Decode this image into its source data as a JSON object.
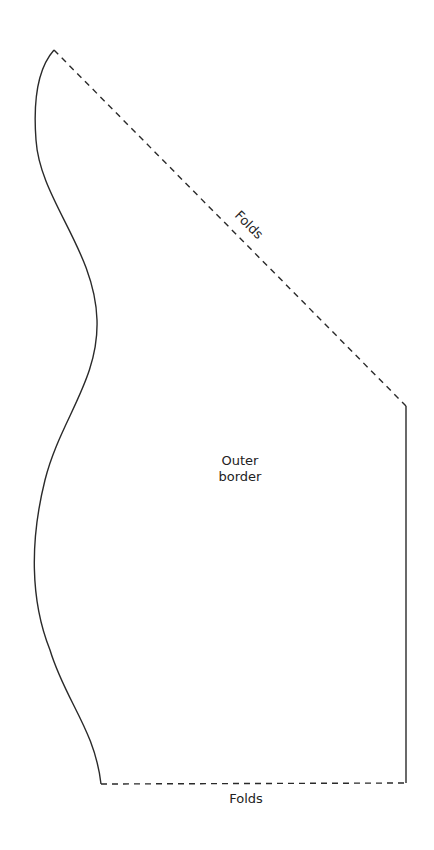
{
  "diagram": {
    "labels": {
      "top_fold": "Folds",
      "bottom_fold": "Folds",
      "center_line1": "Outer",
      "center_line2": "border"
    },
    "edges": {
      "left_curve": "solid",
      "right_side": "solid",
      "top_diagonal": "dashed",
      "bottom": "dashed"
    },
    "colors": {
      "line": "#2a2a2a",
      "text": "#222222",
      "background": "#ffffff"
    }
  }
}
